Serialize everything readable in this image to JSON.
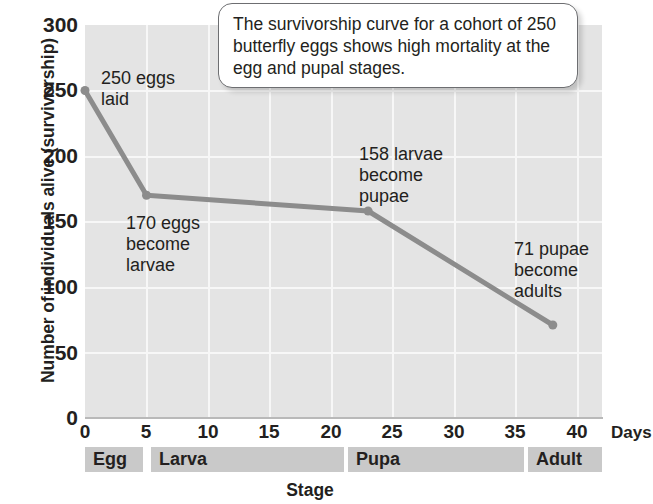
{
  "chart_data": {
    "type": "line",
    "title": "",
    "xlabel": "Stage",
    "ylabel": "Number of individuals alive (survivorship)",
    "x_unit_label": "Days",
    "xlim": [
      0,
      42
    ],
    "ylim": [
      0,
      300
    ],
    "grid": true,
    "legend": "none",
    "x": [
      0,
      5,
      23,
      38
    ],
    "values": [
      250,
      170,
      158,
      71
    ],
    "series": [
      {
        "name": "Survivorship",
        "x": [
          0,
          5,
          23,
          38
        ],
        "values": [
          250,
          170,
          158,
          71
        ],
        "color": "#8c8c8c"
      }
    ],
    "xticks": [
      0,
      5,
      10,
      15,
      20,
      25,
      30,
      35,
      40
    ],
    "xtick_labels": [
      "0",
      "5",
      "10",
      "15",
      "20",
      "25",
      "30",
      "35",
      "40"
    ],
    "yticks": [
      0,
      50,
      100,
      150,
      200,
      250,
      300
    ],
    "ytick_labels": [
      "0",
      "50",
      "100",
      "150",
      "200",
      "250",
      "300"
    ],
    "stage_bands": [
      {
        "label": "Egg",
        "start": 0,
        "end": 5
      },
      {
        "label": "Larva",
        "start": 5.4,
        "end": 22.3
      },
      {
        "label": "Pupa",
        "start": 22.7,
        "end": 37.3
      },
      {
        "label": "Adult",
        "start": 37.7,
        "end": 42
      }
    ],
    "annotations": [
      {
        "text": "250 eggs\nlaid",
        "x_px": 101,
        "y_px": 68
      },
      {
        "text": "170 eggs\nbecome\nlarvae",
        "x_px": 126,
        "y_px": 213
      },
      {
        "text": "158 larvae\nbecome\npupae",
        "x_px": 359,
        "y_px": 144
      },
      {
        "text": "71 pupae\nbecome\nadults",
        "x_px": 514,
        "y_px": 239
      }
    ],
    "callout": {
      "text": "The survivorship curve for a cohort of 250 butterfly eggs shows high mortality at the egg and pupal stages."
    },
    "colors": {
      "line": "#8c8c8c",
      "plot_background": "#e4e4e4",
      "gridline": "#f7f7f7",
      "band": "#c9c9c9",
      "text": "#231f20"
    }
  }
}
